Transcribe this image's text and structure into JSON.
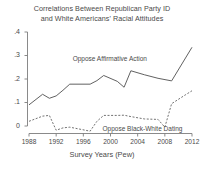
{
  "chart_data": {
    "type": "line",
    "title": "Correlations Between Republican Party ID and White Americans' Racial Attitudes",
    "title_line1": "Correlations Between Republican Party ID",
    "title_line2": "and White Americans' Racial Attitudes",
    "xlabel": "Survey Years (Pew)",
    "ylabel": "",
    "xlim": [
      1987,
      2013
    ],
    "ylim": [
      -0.04,
      0.4
    ],
    "grid": false,
    "legend_position": "inline-annotation",
    "xticks": [
      "1988",
      "1992",
      "1996",
      "2000",
      "2004",
      "2008",
      "2012"
    ],
    "xtick_values": [
      1988,
      1992,
      1996,
      2000,
      2004,
      2008,
      2012
    ],
    "yticks": [
      "0",
      ".1",
      ".2",
      ".3",
      ".4"
    ],
    "ytick_values": [
      0,
      0.1,
      0.2,
      0.3,
      0.4
    ],
    "annotations": [
      {
        "text": "Oppose Affirmative Action",
        "x": 2001.2,
        "y": 0.285
      },
      {
        "text": "Oppose Black-White Dating",
        "x": 2005.6,
        "y": -0.013
      }
    ],
    "series": [
      {
        "name": "Oppose Affirmative Action",
        "style": "solid",
        "color": "#595959",
        "x": [
          1988,
          1990,
          1991,
          1992,
          1993,
          1994,
          1997,
          1998,
          1999,
          2001,
          2002,
          2003,
          2005,
          2007,
          2009,
          2012
        ],
        "values": [
          0.09,
          0.135,
          0.118,
          0.128,
          0.152,
          0.178,
          0.178,
          0.193,
          0.215,
          0.19,
          0.165,
          0.235,
          0.218,
          0.203,
          0.192,
          0.335
        ]
      },
      {
        "name": "Oppose Black-White Dating",
        "style": "dashed",
        "color": "#595959",
        "x": [
          1988,
          1990,
          1991,
          1992,
          1993,
          1994,
          1997,
          1998,
          1999,
          2001,
          2002,
          2003,
          2005,
          2007,
          2008,
          2009,
          2011,
          2012
        ],
        "values": [
          0.02,
          0.042,
          0.045,
          -0.018,
          -0.008,
          -0.005,
          -0.022,
          0.02,
          0.045,
          0.045,
          0.046,
          0.04,
          0.03,
          0.028,
          -0.005,
          0.095,
          0.132,
          0.15
        ]
      }
    ]
  }
}
